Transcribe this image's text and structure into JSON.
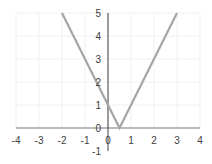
{
  "chart_data": {
    "type": "line",
    "title": "",
    "xlabel": "",
    "ylabel": "",
    "function": "y = |2x - 1|",
    "xlim": [
      -4,
      4
    ],
    "ylim": [
      -1,
      5
    ],
    "grid": true,
    "x_ticks": [
      "-4",
      "-3",
      "-2",
      "-1",
      "0",
      "1",
      "2",
      "3",
      "4"
    ],
    "y_ticks": [
      "-1",
      "0",
      "1",
      "2",
      "3",
      "4",
      "5"
    ],
    "series": [
      {
        "name": "y = |2x - 1|",
        "color": "#a6a6a6",
        "points": [
          [
            -2,
            5
          ],
          [
            0,
            1
          ],
          [
            0.5,
            0
          ],
          [
            1,
            1
          ],
          [
            3,
            5
          ]
        ]
      }
    ]
  },
  "colors": {
    "axis": "#404040",
    "xaxis": "#a6a6a6",
    "grid": "#f0f0f0",
    "line": "#a6a6a6"
  }
}
